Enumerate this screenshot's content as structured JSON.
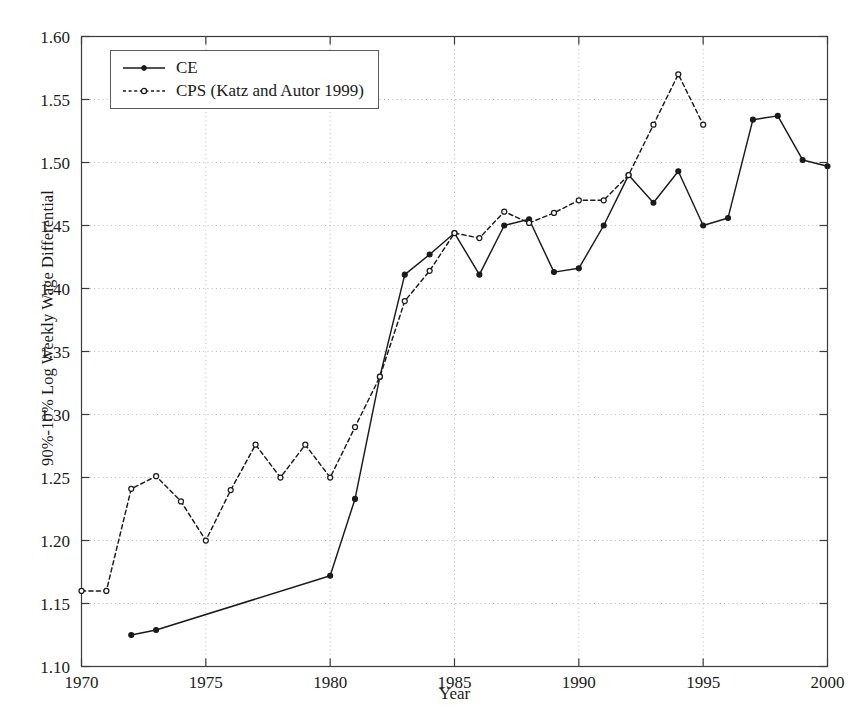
{
  "chart_data": {
    "type": "line",
    "title": "",
    "xlabel": "Year",
    "ylabel": "90%-10% Log Weekly Wage Differential",
    "xlim": [
      1970,
      2000
    ],
    "ylim": [
      1.1,
      1.6
    ],
    "xticks": [
      1970,
      1975,
      1980,
      1985,
      1990,
      1995,
      2000
    ],
    "yticks": [
      1.1,
      1.15,
      1.2,
      1.25,
      1.3,
      1.35,
      1.4,
      1.45,
      1.5,
      1.55,
      1.6
    ],
    "ytick_labels": [
      "1.10",
      "1.15",
      "1.20",
      "1.25",
      "1.30",
      "1.35",
      "1.40",
      "1.45",
      "1.50",
      "1.55",
      "1.60"
    ],
    "xtick_labels": [
      "1970",
      "1975",
      "1980",
      "1985",
      "1990",
      "1995",
      "2000"
    ],
    "grid": true,
    "grid_style": "dotted",
    "legend_position": "upper left",
    "series": [
      {
        "name": "CE",
        "style": "solid",
        "marker": "filled-circle",
        "color": "#1a1a1a",
        "x": [
          1972,
          1973,
          1980,
          1981,
          1982,
          1983,
          1984,
          1985,
          1986,
          1987,
          1988,
          1989,
          1990,
          1991,
          1992,
          1993,
          1994,
          1995,
          1996,
          1997,
          1998,
          1999,
          2000
        ],
        "y": [
          1.125,
          1.129,
          1.172,
          1.233,
          1.33,
          1.411,
          1.427,
          1.444,
          1.411,
          1.45,
          1.455,
          1.413,
          1.416,
          1.45,
          1.49,
          1.468,
          1.493,
          1.45,
          1.456,
          1.534,
          1.537,
          1.502,
          1.497
        ]
      },
      {
        "name": "CPS (Katz and Autor 1999)",
        "style": "dashed",
        "marker": "open-circle",
        "color": "#1a1a1a",
        "x": [
          1970,
          1971,
          1972,
          1973,
          1974,
          1975,
          1976,
          1977,
          1978,
          1979,
          1980,
          1981,
          1982,
          1983,
          1984,
          1985,
          1986,
          1987,
          1988,
          1989,
          1990,
          1991,
          1992,
          1993,
          1994,
          1995
        ],
        "y": [
          1.16,
          1.16,
          1.241,
          1.251,
          1.231,
          1.2,
          1.24,
          1.276,
          1.25,
          1.276,
          1.25,
          1.29,
          1.33,
          1.39,
          1.414,
          1.444,
          1.44,
          1.461,
          1.452,
          1.46,
          1.47,
          1.47,
          1.49,
          1.53,
          1.57,
          1.53
        ]
      }
    ]
  },
  "legend": {
    "entries": [
      {
        "label": "CE"
      },
      {
        "label": "CPS (Katz and Autor 1999)"
      }
    ]
  },
  "axes": {
    "x_title": "Year",
    "y_title": "90%-10% Log Weekly Wage Differential"
  }
}
